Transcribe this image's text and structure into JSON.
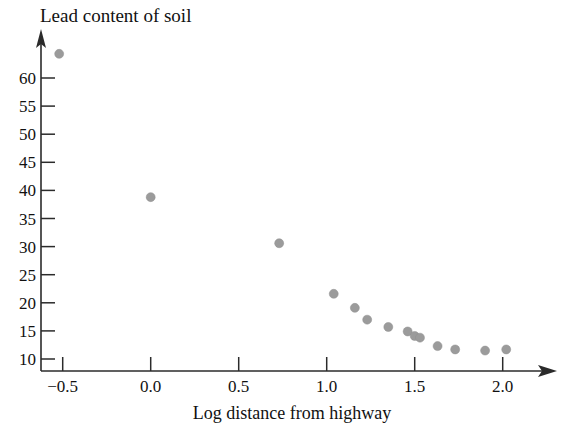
{
  "chart_data": {
    "type": "scatter",
    "title": "Lead content of soil",
    "xlabel": "Log distance from highway",
    "ylabel": "",
    "xlim": [
      -0.72,
      2.28
    ],
    "ylim": [
      9.0,
      66.5
    ],
    "grid": false,
    "legend": null,
    "xticks": [
      -0.5,
      0.0,
      0.5,
      1.0,
      1.5,
      2.0
    ],
    "xticklabels": [
      "−0.5",
      "0.0",
      "0.5",
      "1.0",
      "1.5",
      "2.0"
    ],
    "yticks": [
      10,
      15,
      20,
      25,
      30,
      35,
      40,
      45,
      50,
      55,
      60
    ],
    "yticklabels": [
      "10",
      "15",
      "20",
      "25",
      "30",
      "35",
      "40",
      "45",
      "50",
      "55",
      "60"
    ],
    "marker": {
      "shape": "circle",
      "color": "#9b9b9b",
      "size_px": 9
    },
    "x": [
      -0.52,
      0.0,
      0.73,
      1.04,
      1.16,
      1.23,
      1.35,
      1.46,
      1.5,
      1.53,
      1.63,
      1.73,
      1.9,
      2.02
    ],
    "y": [
      64.3,
      38.8,
      30.6,
      21.6,
      19.1,
      17.0,
      15.7,
      14.9,
      14.1,
      13.8,
      12.3,
      11.7,
      11.5,
      11.7
    ],
    "points": [
      {
        "x": -0.52,
        "y": 64.3
      },
      {
        "x": 0.0,
        "y": 38.8
      },
      {
        "x": 0.73,
        "y": 30.6
      },
      {
        "x": 1.04,
        "y": 21.6
      },
      {
        "x": 1.16,
        "y": 19.1
      },
      {
        "x": 1.23,
        "y": 17.0
      },
      {
        "x": 1.35,
        "y": 15.7
      },
      {
        "x": 1.46,
        "y": 14.9
      },
      {
        "x": 1.5,
        "y": 14.1
      },
      {
        "x": 1.53,
        "y": 13.8
      },
      {
        "x": 1.63,
        "y": 12.3
      },
      {
        "x": 1.73,
        "y": 11.7
      },
      {
        "x": 1.9,
        "y": 11.5
      },
      {
        "x": 2.02,
        "y": 11.7
      }
    ]
  },
  "axes": {
    "x_axis_arrow": "arrow-right-icon",
    "y_axis_arrow": "arrow-up-icon"
  }
}
